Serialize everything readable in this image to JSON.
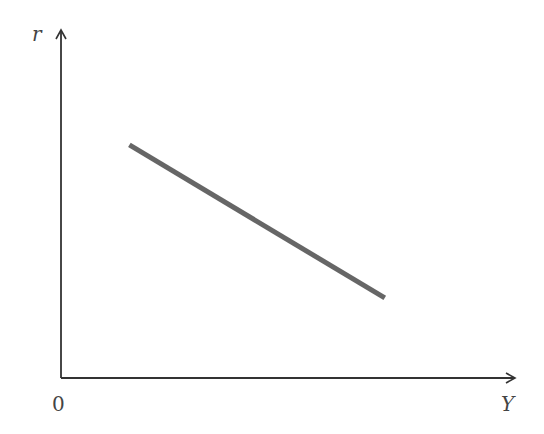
{
  "chart_data": {
    "type": "line",
    "title": "",
    "xlabel": "Y",
    "ylabel": "r",
    "origin_label": "0",
    "grid": false,
    "legend": null,
    "ticks": false,
    "series": [
      {
        "name": "IS curve",
        "color": "#666666",
        "points": [
          {
            "x": 0.15,
            "y": 0.67
          },
          {
            "x": 0.71,
            "y": 0.23
          }
        ]
      }
    ],
    "xlim": [
      0,
      1
    ],
    "ylim": [
      0,
      1
    ]
  },
  "labels": {
    "y_axis": "r",
    "x_axis": "Y",
    "origin": "0"
  },
  "colors": {
    "axis": "#333333",
    "line": "#666666"
  }
}
